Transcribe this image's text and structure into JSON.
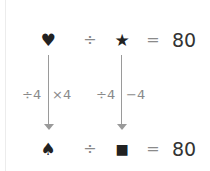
{
  "top_equation": {
    "left_symbol": "♥",
    "operator": "÷",
    "right_symbol": "★",
    "equals": "=",
    "result": "80"
  },
  "bottom_equation": {
    "left_symbol": "♠",
    "operator": "÷",
    "right_symbol": "■",
    "equals": "=",
    "result": "80"
  },
  "transforms": {
    "left": {
      "before": "÷4",
      "after": "×4"
    },
    "right": {
      "before": "÷4",
      "after": "−4"
    }
  },
  "colors": {
    "symbol": "#222222",
    "operator": "#8a8a8a",
    "arrow": "#9a9a9a",
    "text": "#333333"
  }
}
